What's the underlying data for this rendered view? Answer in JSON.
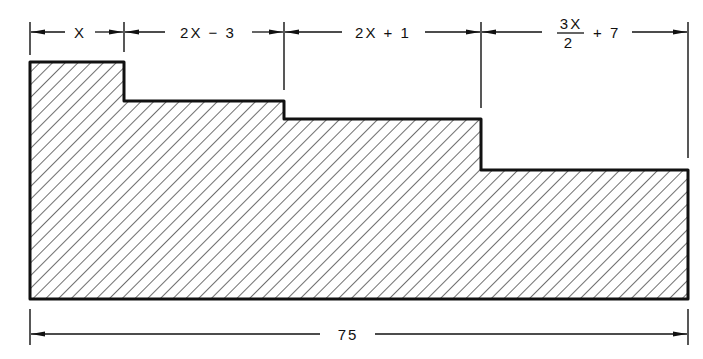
{
  "diagram": {
    "type": "dimensioned stepped cross-section",
    "segments": [
      {
        "id": "seg1",
        "label": "X",
        "x_start": 30,
        "x_end": 124,
        "top_y": 62
      },
      {
        "id": "seg2",
        "label": "2X − 3",
        "x_start": 124,
        "x_end": 284,
        "top_y": 101
      },
      {
        "id": "seg3",
        "label": "2X + 1",
        "x_start": 284,
        "x_end": 481,
        "top_y": 119
      },
      {
        "id": "seg4",
        "label_num": "3X",
        "label_den": "2",
        "label_suffix": "+ 7",
        "x_start": 481,
        "x_end": 688,
        "top_y": 170
      }
    ],
    "total": {
      "label": "75"
    },
    "colors": {
      "ink": "#111111",
      "background": "#ffffff"
    }
  }
}
